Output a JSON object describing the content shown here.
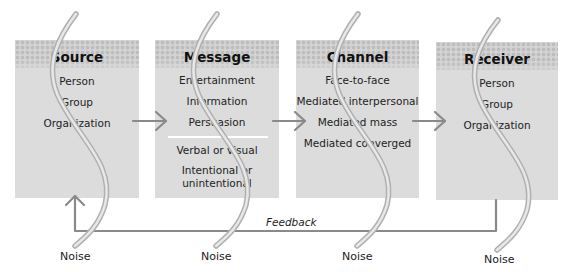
{
  "diagram": {
    "type": "communication-process-model",
    "boxes": [
      {
        "title": "Source",
        "items": [
          "Person",
          "Group",
          "Organization"
        ]
      },
      {
        "title": "Message",
        "items": [
          "Entertainment",
          "Information",
          "Persuasion"
        ],
        "items_below_divider": [
          "Verbal or visual",
          "Intentional or",
          "unintentional"
        ]
      },
      {
        "title": "Channel",
        "items": [
          "Face-to-face",
          "Mediated interpersonal",
          "Mediated mass",
          "Mediated converged"
        ]
      },
      {
        "title": "Receiver",
        "items": [
          "Person",
          "Group",
          "Organization"
        ]
      }
    ],
    "noise_labels": [
      "Noise",
      "Noise",
      "Noise",
      "Noise"
    ],
    "feedback_label": "Feedback",
    "colors": {
      "box_fill": "#dcdcdc",
      "dot_pattern": "#bdbdbd",
      "arrow": "#8a8a8a",
      "noise_curve": "#c8c8c8"
    }
  }
}
